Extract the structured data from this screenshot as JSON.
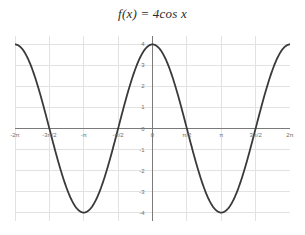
{
  "chart_data": {
    "type": "line",
    "title": "f(x) = 4cos x",
    "xlabel": "",
    "ylabel": "",
    "xlim": [
      -6.283185307,
      6.283185307
    ],
    "ylim": [
      -4.4,
      4.4
    ],
    "grid": true,
    "legend": "none",
    "axis_color": "#7a7a7a",
    "grid_color": "#e2e2e2",
    "line_color": "#3a3a3a",
    "line_width": 1.8,
    "background": "#ffffff",
    "xticks": [
      {
        "value": -6.283185307,
        "label": "-2π"
      },
      {
        "value": -4.71238898,
        "label": "-3π/2"
      },
      {
        "value": -3.141592654,
        "label": "-π"
      },
      {
        "value": -1.570796327,
        "label": "-π/2"
      },
      {
        "value": 0,
        "label": "0"
      },
      {
        "value": 1.570796327,
        "label": "π/2"
      },
      {
        "value": 3.141592654,
        "label": "π"
      },
      {
        "value": 4.71238898,
        "label": "3π/2"
      },
      {
        "value": 6.283185307,
        "label": "2π"
      }
    ],
    "yticks": [
      {
        "value": 4,
        "label": "4"
      },
      {
        "value": 3,
        "label": "3"
      },
      {
        "value": 2,
        "label": "2"
      },
      {
        "value": 1,
        "label": "1"
      },
      {
        "value": 0,
        "label": "0"
      },
      {
        "value": -1,
        "label": "-1"
      },
      {
        "value": -2,
        "label": "-2"
      },
      {
        "value": -3,
        "label": "-3"
      },
      {
        "value": -4,
        "label": "-4"
      }
    ],
    "series": [
      {
        "name": "f(x) = 4cos x",
        "expression": "4*cos(x)",
        "amplitude": 4,
        "period": 6.283185307,
        "points": [
          {
            "x": -6.283185307,
            "y": 4
          },
          {
            "x": -5.497787144,
            "y": 2.828427125
          },
          {
            "x": -4.71238898,
            "y": 0
          },
          {
            "x": -3.926990817,
            "y": -2.828427125
          },
          {
            "x": -3.141592654,
            "y": -4
          },
          {
            "x": -2.35619449,
            "y": -2.828427125
          },
          {
            "x": -1.570796327,
            "y": 0
          },
          {
            "x": -0.785398163,
            "y": 2.828427125
          },
          {
            "x": 0,
            "y": 4
          },
          {
            "x": 0.785398163,
            "y": 2.828427125
          },
          {
            "x": 1.570796327,
            "y": 0
          },
          {
            "x": 2.35619449,
            "y": -2.828427125
          },
          {
            "x": 3.141592654,
            "y": -4
          },
          {
            "x": 3.926990817,
            "y": -2.828427125
          },
          {
            "x": 4.71238898,
            "y": 0
          },
          {
            "x": 5.497787144,
            "y": 2.828427125
          },
          {
            "x": 6.283185307,
            "y": 4
          }
        ],
        "maxima_at": [
          -6.283185307,
          0,
          6.283185307
        ],
        "minima_at": [
          -3.141592654,
          3.141592654
        ],
        "zeros_at": [
          -4.71238898,
          -1.570796327,
          1.570796327,
          4.71238898
        ]
      }
    ]
  }
}
